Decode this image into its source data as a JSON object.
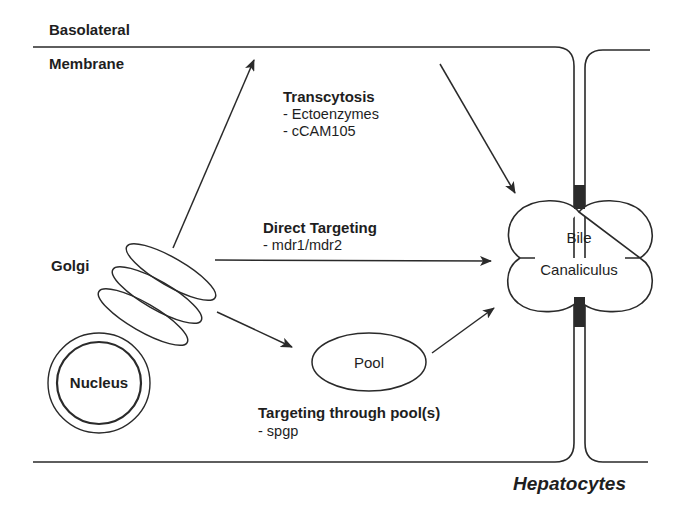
{
  "membrane": {
    "top_label": "Basolateral",
    "bottom_label": "Membrane"
  },
  "organelles": {
    "golgi": "Golgi",
    "nucleus": "Nucleus",
    "pool": "Pool",
    "bile_line1": "Bile",
    "bile_line2": "Canaliculus"
  },
  "pathways": [
    {
      "title": "Transcytosis",
      "items": [
        "- Ectoenzymes",
        "- cCAM105"
      ]
    },
    {
      "title": "Direct Targeting",
      "items": [
        "- mdr1/mdr2"
      ]
    },
    {
      "title": "Targeting through pool(s)",
      "items": [
        "- spgp"
      ]
    }
  ],
  "caption": "Hepatocytes",
  "colors": {
    "line": "#2a2a2a",
    "tight_junction": "#2b2b2b",
    "background": "#ffffff"
  }
}
